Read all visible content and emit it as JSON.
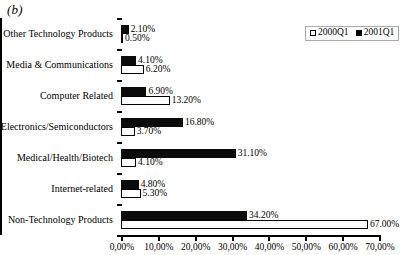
{
  "panel": {
    "label": "(b)"
  },
  "legend": {
    "position": "top-right",
    "entries": [
      {
        "label": "2000Q1",
        "swatch": "hollow-square-icon",
        "color": "#ffffff"
      },
      {
        "label": "2001Q1",
        "swatch": "filled-square-icon",
        "color": "#000000"
      }
    ]
  },
  "chart_data": {
    "type": "bar",
    "orientation": "horizontal",
    "title": "(b)",
    "xlabel": "",
    "ylabel": "",
    "xlim": [
      0,
      70
    ],
    "grid": false,
    "legend_position": "top-right",
    "tick_labels": [
      "0,00%",
      "10,00%",
      "20,00%",
      "30,00%",
      "40,00%",
      "50,00%",
      "60,00%",
      "70,00%"
    ],
    "tick_values": [
      0,
      10,
      20,
      30,
      40,
      50,
      60,
      70
    ],
    "categories": [
      "Other Technology Products",
      "Media & Communications",
      "Computer Related",
      "Electronics/Semiconductors",
      "Medical/Health/Biotech",
      "Internet-related",
      "Non-Technology Products"
    ],
    "series": [
      {
        "name": "2001Q1",
        "style": "solid",
        "color": "#000000",
        "values": [
          2.1,
          4.1,
          6.9,
          16.8,
          31.1,
          4.8,
          34.2
        ],
        "labels": [
          "2.10%",
          "4.10%",
          "6.90%",
          "16.80%",
          "31.10%",
          "4.80%",
          "34.20%"
        ]
      },
      {
        "name": "2000Q1",
        "style": "hollow",
        "color": "#ffffff",
        "values": [
          0.5,
          6.2,
          13.2,
          3.7,
          4.1,
          5.3,
          67.0
        ],
        "labels": [
          "0.50%",
          "6.20%",
          "13.20%",
          "3.70%",
          "4.10%",
          "5.30%",
          "67.00%"
        ]
      }
    ]
  }
}
